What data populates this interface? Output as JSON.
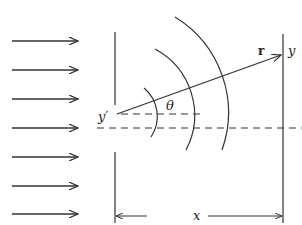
{
  "diagram": {
    "labels": {
      "source_point": "y′",
      "observation_point": "y",
      "position_vector": "r",
      "angle": "θ",
      "distance": "x"
    },
    "incident_arrows": {
      "count": 7,
      "y_positions": [
        41,
        70,
        99,
        128,
        157,
        186,
        214
      ]
    },
    "wavefront_arcs": {
      "count": 3
    },
    "colors": {
      "stroke": "#333333",
      "background": "#ffffff"
    }
  }
}
